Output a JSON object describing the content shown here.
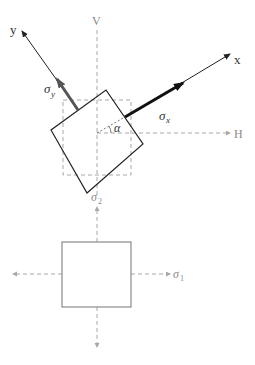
{
  "diagram": {
    "colors": {
      "axis": "#222222",
      "dashed": "#a8a8a8",
      "element": "#222222",
      "principal_element": "#8a8a8a",
      "sigma_x_arrow": "#111111",
      "sigma_y_arrow": "#555555"
    },
    "labels": {
      "x_axis": "x",
      "y_axis": "y",
      "vertical_axis": "V",
      "horizontal_axis": "H",
      "sigma_x": "σ",
      "sigma_x_sub": "x",
      "sigma_y": "σ",
      "sigma_y_sub": "y",
      "angle": "α",
      "sigma_1": "σ",
      "sigma_1_sub": "1",
      "sigma_2": "σ",
      "sigma_2_sub": "2"
    },
    "top_figure": {
      "origin": [
        97,
        133
      ],
      "rotated_element_corners": [
        [
          106,
          90
        ],
        [
          143,
          144
        ],
        [
          87,
          193
        ],
        [
          51,
          130
        ]
      ],
      "reference_dashed_square": {
        "x": 63,
        "y": 100,
        "w": 68,
        "h": 75
      },
      "x_axis": {
        "from": [
          125,
          117
        ],
        "to": [
          230,
          54
        ]
      },
      "y_axis": {
        "from": [
          78,
          110
        ],
        "to": [
          22,
          31
        ]
      }
    },
    "bottom_figure": {
      "principal_element": {
        "x": 62,
        "y": 242,
        "w": 69,
        "h": 65
      },
      "center": [
        97,
        274
      ]
    }
  }
}
